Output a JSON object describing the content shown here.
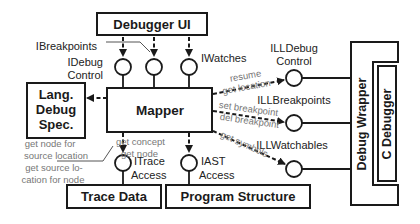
{
  "diagram": {
    "boxes": {
      "debugger_ui": "Debugger UI",
      "mapper": "Mapper",
      "lang_debug_spec": [
        "Lang.",
        "Debug",
        "Spec."
      ],
      "trace_data": "Trace Data",
      "program_structure": "Program Structure",
      "debug_wrapper": "Debug Wrapper",
      "c_debugger": "C Debugger"
    },
    "interfaces": {
      "ibreakpoints": "IBreakpoints",
      "idebug_control": [
        "IDebug",
        "Control"
      ],
      "iwatches": "IWatches",
      "itrace_access": [
        "ITrace",
        "Access"
      ],
      "iast_access": [
        "IAST",
        "Access"
      ],
      "illdebug_control": [
        "ILLDebug",
        "Control"
      ],
      "illbreakpoints": "ILLBreakpoints",
      "illwatchables": "ILLWatchables"
    },
    "annotations": {
      "resume_get_location": [
        "resume",
        "get location"
      ],
      "set_del_breakpoint": [
        "set breakpoint",
        "del breakpoint"
      ],
      "get_symbols": "get symbols",
      "get_concept_node": [
        "get concept",
        "get node"
      ],
      "source_location": [
        "get node for",
        "source location",
        "get source lo-",
        "cation for node"
      ]
    }
  }
}
